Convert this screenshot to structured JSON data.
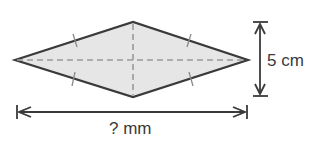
{
  "diagram": {
    "shape": "rhombus",
    "vertical_diagonal_label": "5 cm",
    "horizontal_diagonal_label": "? mm",
    "colors": {
      "fill": "#e6e6e6",
      "stroke": "#3a3a3a",
      "dashed": "#9a9a9a",
      "tick": "#8a8a8a"
    }
  }
}
